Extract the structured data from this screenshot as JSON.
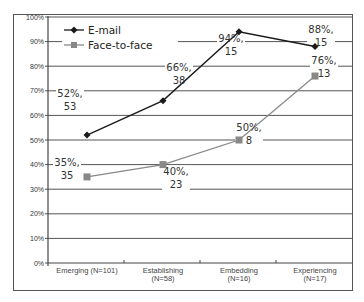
{
  "chart_data": {
    "type": "line",
    "title": "",
    "xlabel": "",
    "ylabel": "",
    "ylim": [
      0,
      100
    ],
    "y_ticks": [
      "0%",
      "10%",
      "20%",
      "30%",
      "40%",
      "50%",
      "60%",
      "70%",
      "80%",
      "90%",
      "100%"
    ],
    "categories": [
      {
        "line1": "Emerging (N=101)",
        "line2": ""
      },
      {
        "line1": "Establishing",
        "line2": "(N=58)"
      },
      {
        "line1": "Embedding",
        "line2": "(N=16)"
      },
      {
        "line1": "Experiencing",
        "line2": "(N=17)"
      }
    ],
    "series": [
      {
        "name": "E-mail",
        "color": "#1a1a1a",
        "marker": "diamond",
        "values": [
          52,
          66,
          94,
          88
        ],
        "counts": [
          53,
          38,
          15,
          15
        ],
        "labels": [
          {
            "pct": "52%,",
            "n": "53"
          },
          {
            "pct": "66%,",
            "n": "38"
          },
          {
            "pct": "94%,",
            "n": "15"
          },
          {
            "pct": "88%,",
            "n": "15"
          }
        ]
      },
      {
        "name": "Face-to-face",
        "color": "#888888",
        "marker": "square",
        "values": [
          35,
          40,
          50,
          76
        ],
        "counts": [
          35,
          23,
          8,
          13
        ],
        "labels": [
          {
            "pct": "35%,",
            "n": "35"
          },
          {
            "pct": "40%,",
            "n": "23"
          },
          {
            "pct": "50%,",
            "n": "8"
          },
          {
            "pct": "76%,",
            "n": "13"
          }
        ]
      }
    ],
    "grid": true,
    "legend_position": "top-left"
  }
}
